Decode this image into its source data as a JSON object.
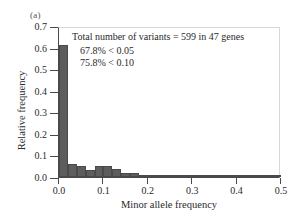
{
  "panel_label": "(a)",
  "annotations": {
    "total_variants_text": "Total number of variants = 599 in 47 genes",
    "line1": "67.8% < 0.05",
    "line2": "75.8% < 0.10"
  },
  "axes": {
    "xlabel": "Minor allele frequency",
    "ylabel": "Relative frequency",
    "xticks": [
      "0.0",
      "0.1",
      "0.2",
      "0.3",
      "0.4",
      "0.5"
    ],
    "yticks": [
      "0.0",
      "0.1",
      "0.2",
      "0.3",
      "0.4",
      "0.5",
      "0.6",
      "0.7"
    ]
  },
  "style": {
    "bar_fill": "#5d5d5d",
    "bar_edge": "#4a4a4a",
    "axis_color": "#4a4a4a"
  },
  "chart_data": {
    "type": "bar",
    "title": "Total number of variants = 599 in 47 genes",
    "xlabel": "Minor allele frequency",
    "ylabel": "Relative frequency",
    "xlim": [
      0.0,
      0.5
    ],
    "ylim": [
      0.0,
      0.7
    ],
    "grid": false,
    "legend": "none",
    "bin_width": 0.02,
    "bin_starts": [
      0.0,
      0.02,
      0.04,
      0.06,
      0.08,
      0.1,
      0.12,
      0.14,
      0.16,
      0.18,
      0.2,
      0.22,
      0.24,
      0.26,
      0.28,
      0.3,
      0.32,
      0.34,
      0.36,
      0.38,
      0.4,
      0.42,
      0.44,
      0.46,
      0.48
    ],
    "categories": [
      "0.00-0.02",
      "0.02-0.04",
      "0.04-0.06",
      "0.06-0.08",
      "0.08-0.10",
      "0.10-0.12",
      "0.12-0.14",
      "0.14-0.16",
      "0.16-0.18",
      "0.18-0.20",
      "0.20-0.22",
      "0.22-0.24",
      "0.24-0.26",
      "0.26-0.28",
      "0.28-0.30",
      "0.30-0.32",
      "0.32-0.34",
      "0.34-0.36",
      "0.36-0.38",
      "0.38-0.40",
      "0.40-0.42",
      "0.42-0.44",
      "0.44-0.46",
      "0.46-0.48",
      "0.48-0.50"
    ],
    "values": [
      0.613,
      0.062,
      0.049,
      0.031,
      0.052,
      0.052,
      0.037,
      0.019,
      0.018,
      0.01,
      0.007,
      0.007,
      0.007,
      0.007,
      0.007,
      0.008,
      0.007,
      0.007,
      0.011,
      0.011,
      0.007,
      0.005,
      0.007,
      0.007,
      0.007
    ],
    "annotations": [
      "67.8% < 0.05",
      "75.8% < 0.10"
    ]
  }
}
